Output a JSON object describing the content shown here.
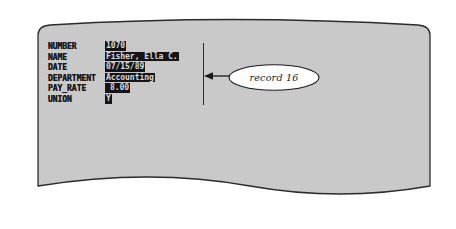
{
  "document": {
    "kind": "database-record-display",
    "shape": "curved-screen-page",
    "fill_color": "#c9c9c9",
    "border_color": "#2b2b2b"
  },
  "record": {
    "fields": [
      {
        "label": "NUMBER",
        "value": "1070",
        "highlighted": true
      },
      {
        "label": "NAME",
        "value": "Fisher, Ella C.",
        "highlighted": true
      },
      {
        "label": "DATE",
        "value": "07/15/89",
        "highlighted": true
      },
      {
        "label": "DEPARTMENT",
        "value": "Accounting",
        "highlighted": true
      },
      {
        "label": "PAY_RATE",
        "value": "8.00",
        "highlighted": true
      },
      {
        "label": "UNION",
        "value": "Y",
        "highlighted": true
      }
    ],
    "value_background": "#151515",
    "value_text_color": "#d9d9d9"
  },
  "annotation": {
    "callout_label": "record 16",
    "bracket_present": true,
    "arrow_direction": "left",
    "ellipse_fill": "#ffffff",
    "ellipse_stroke": "#1a1a1a"
  }
}
